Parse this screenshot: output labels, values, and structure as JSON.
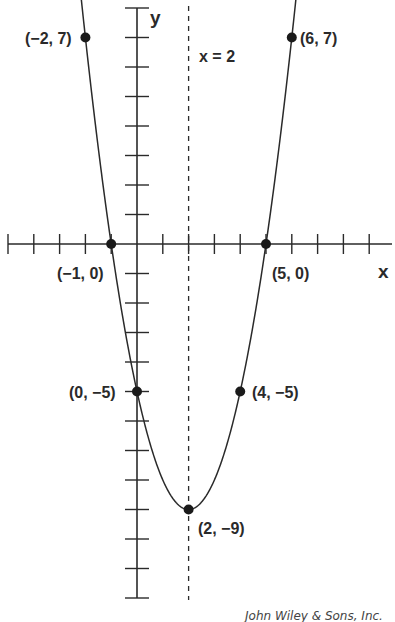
{
  "chart_data": {
    "type": "line",
    "title": "",
    "function": "y = x^2 - 4x - 5",
    "xlabel": "x",
    "ylabel": "y",
    "xlim": [
      -5,
      9
    ],
    "ylim": [
      -12,
      8
    ],
    "grid": false,
    "axis_of_symmetry": {
      "label": "x = 2",
      "x": 2,
      "style": "dashed"
    },
    "points": [
      {
        "x": -2,
        "y": 7,
        "label": "(−2, 7)"
      },
      {
        "x": 6,
        "y": 7,
        "label": "(6, 7)"
      },
      {
        "x": -1,
        "y": 0,
        "label": "(−1, 0)"
      },
      {
        "x": 5,
        "y": 0,
        "label": "(5, 0)"
      },
      {
        "x": 0,
        "y": -5,
        "label": "(0, −5)"
      },
      {
        "x": 4,
        "y": -5,
        "label": "(4, −5)"
      },
      {
        "x": 2,
        "y": -9,
        "label": "(2, −9)"
      }
    ],
    "x_ticks": [
      -5,
      -4,
      -3,
      -2,
      -1,
      0,
      1,
      2,
      3,
      4,
      5,
      6,
      7,
      8,
      9
    ],
    "y_ticks": [
      8,
      7,
      6,
      5,
      4,
      3,
      2,
      1,
      0,
      -1,
      -2,
      -3,
      -4,
      -5,
      -6,
      -7,
      -8,
      -9,
      -10,
      -11,
      -12
    ]
  },
  "labels": {
    "x_axis": "x",
    "y_axis": "y",
    "symmetry": "x = 2",
    "p_m2_7": "(−2, 7)",
    "p_6_7": "(6, 7)",
    "p_m1_0": "(−1, 0)",
    "p_5_0": "(5, 0)",
    "p_0_m5": "(0, −5)",
    "p_4_m5": "(4, −5)",
    "p_2_m9": "(2, −9)",
    "credit": "John Wiley & Sons, Inc."
  },
  "colors": {
    "ink": "#2a2a2a",
    "background": "#ffffff"
  }
}
